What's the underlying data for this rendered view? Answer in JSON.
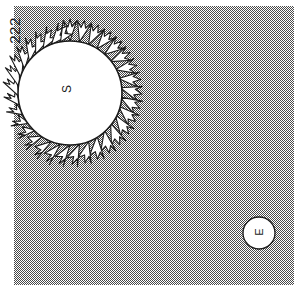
{
  "figure": {
    "number_label": "222",
    "caption_present": false,
    "background_color": "#ffffff",
    "field_fill": "halftone-gray-50",
    "field_color": "#808080",
    "ink_color": "#1a1a1a",
    "width": 294,
    "height": 296
  },
  "field": {
    "name": "space-region",
    "x": 14,
    "y": 6,
    "width": 280,
    "height": 279
  },
  "sun": {
    "label": "S",
    "center_x": 70,
    "center_y": 93,
    "radius": 52,
    "fill": "#ffffff",
    "stroke": "#1a1a1a",
    "ray_count": 34,
    "ray_style": "forked-petal",
    "ray_length_short": 9,
    "ray_length_long": 22
  },
  "earth": {
    "label": "E",
    "center_x": 259,
    "center_y": 233,
    "radius": 16,
    "fill": "#ffffff",
    "stroke": "#1a1a1a"
  },
  "labels": {
    "sun_letter": "S",
    "earth_letter": "E",
    "figure_number": "222"
  }
}
